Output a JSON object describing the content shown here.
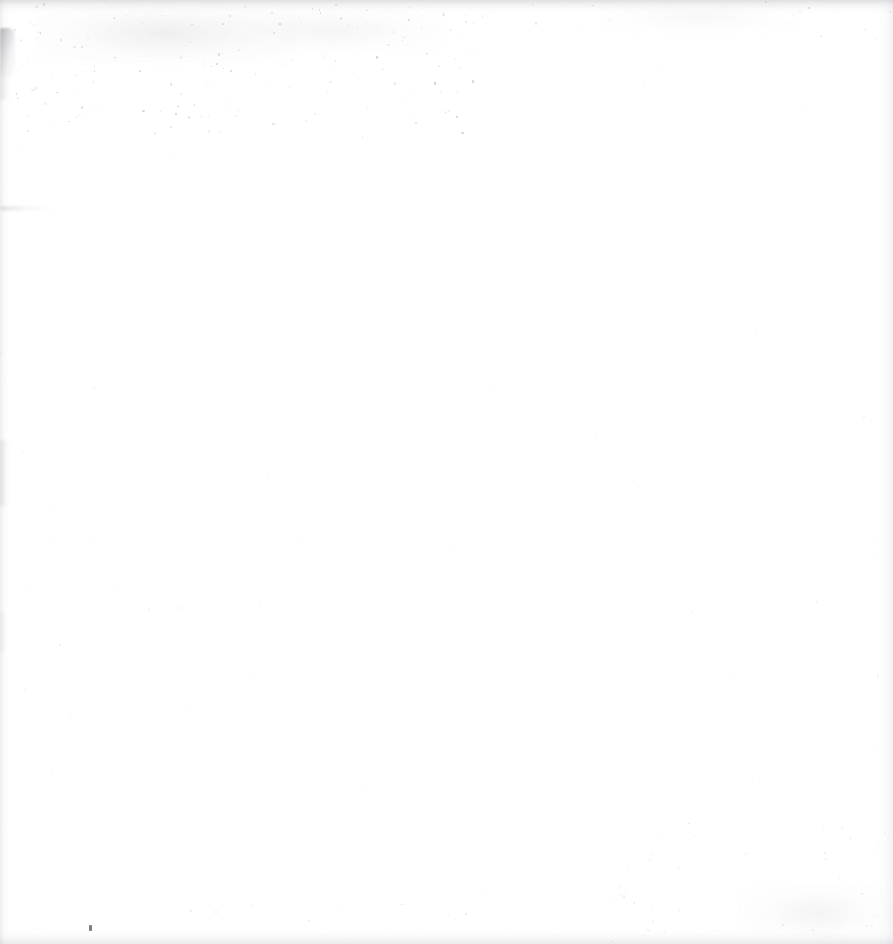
{
  "page": {
    "kind": "scanned-document-page",
    "state": "blank",
    "width": 893,
    "height": 944,
    "paper_color": "#ffffff",
    "paper_tone_edge": "#fdfdfd",
    "visible_text": "",
    "body_text": "",
    "page_number": "",
    "header_text": "",
    "footer_text": ""
  },
  "palette": {
    "paper": "#ffffff",
    "paper_shade": "#fdfdfd",
    "edge_band": "#b4b4bb",
    "blotch_dark": "#787880",
    "speck_dark": "#5c5c63",
    "dust_light": "#f0f0f2",
    "dust_mid": "#e2e2e6"
  },
  "edges": [
    {
      "name": "top-edge-band",
      "side": "top",
      "thickness": 13,
      "intensity": 0.3
    },
    {
      "name": "bottom-edge-band",
      "side": "bottom",
      "thickness": 16,
      "intensity": 0.22
    },
    {
      "name": "left-edge-band",
      "side": "left",
      "thickness": 9,
      "intensity": 0.2
    },
    {
      "name": "right-edge-band",
      "side": "right",
      "thickness": 16,
      "intensity": 0.17
    }
  ],
  "artifacts": [
    {
      "name": "left-margin-blotch",
      "type": "blotch",
      "x": 0,
      "y": 28,
      "w": 15,
      "h": 50,
      "opacity": 1.0
    },
    {
      "name": "left-margin-streak-upper",
      "type": "streak-v",
      "x": 0,
      "y": 78,
      "w": 11,
      "h": 22,
      "opacity": 0.7
    },
    {
      "name": "left-margin-streak-mid",
      "type": "streak-v",
      "x": 0,
      "y": 440,
      "w": 9,
      "h": 66,
      "opacity": 0.85
    },
    {
      "name": "left-margin-streak-low",
      "type": "streak-v",
      "x": 0,
      "y": 612,
      "w": 7,
      "h": 40,
      "opacity": 0.45
    },
    {
      "name": "left-horizontal-smudge",
      "type": "streak-h",
      "x": 0,
      "y": 206,
      "w": 56,
      "h": 5,
      "opacity": 0.9
    },
    {
      "name": "bottom-left-speck",
      "type": "speck",
      "x": 89,
      "y": 925,
      "w": 3,
      "h": 6,
      "opacity": 1.0
    },
    {
      "name": "upper-left-soft-smudge",
      "type": "smudge-soft",
      "x": 36,
      "y": 2,
      "w": 260,
      "h": 62,
      "opacity": 0.9
    },
    {
      "name": "upper-mid-soft-smudge",
      "type": "smudge-soft",
      "x": 215,
      "y": 6,
      "w": 230,
      "h": 48,
      "opacity": 0.55
    },
    {
      "name": "lower-right-soft-smudge",
      "type": "smudge-soft",
      "x": 742,
      "y": 884,
      "w": 150,
      "h": 58,
      "opacity": 0.6
    },
    {
      "name": "top-right-soft-smudge",
      "type": "smudge-soft",
      "x": 600,
      "y": 0,
      "w": 200,
      "h": 34,
      "opacity": 0.4
    }
  ],
  "dust_fields": [
    {
      "name": "dust-top-left-dense",
      "x": 8,
      "y": 0,
      "w": 470,
      "h": 135,
      "count": 170,
      "seed": 1337,
      "min_size": 0.7,
      "max_size": 2.6,
      "min_alpha": 0.05,
      "max_alpha": 0.34,
      "color": "#6e6e76"
    },
    {
      "name": "dust-top-band",
      "x": 0,
      "y": 0,
      "w": 893,
      "h": 40,
      "count": 90,
      "seed": 2911,
      "min_size": 0.6,
      "max_size": 2.0,
      "min_alpha": 0.04,
      "max_alpha": 0.26,
      "color": "#7a7a82"
    },
    {
      "name": "dust-page-sparse",
      "x": 0,
      "y": 60,
      "w": 893,
      "h": 884,
      "count": 230,
      "seed": 5521,
      "min_size": 0.6,
      "max_size": 2.0,
      "min_alpha": 0.02,
      "max_alpha": 0.12,
      "color": "#8c8c95"
    },
    {
      "name": "dust-bottom-right",
      "x": 600,
      "y": 820,
      "w": 293,
      "h": 124,
      "count": 90,
      "seed": 7703,
      "min_size": 0.6,
      "max_size": 2.2,
      "min_alpha": 0.03,
      "max_alpha": 0.17,
      "color": "#82828b"
    },
    {
      "name": "dust-bottom-band",
      "x": 0,
      "y": 900,
      "w": 893,
      "h": 44,
      "count": 70,
      "seed": 9137,
      "min_size": 0.6,
      "max_size": 1.9,
      "min_alpha": 0.03,
      "max_alpha": 0.18,
      "color": "#7d7d86"
    },
    {
      "name": "dust-left-column",
      "x": 0,
      "y": 100,
      "w": 90,
      "h": 800,
      "count": 55,
      "seed": 4243,
      "min_size": 0.6,
      "max_size": 1.8,
      "min_alpha": 0.03,
      "max_alpha": 0.15,
      "color": "#84848d"
    }
  ],
  "regions": [
    {
      "name": "text-block-region",
      "x": 70,
      "y": 80,
      "w": 760,
      "h": 790,
      "content": ""
    },
    {
      "name": "header-region",
      "x": 70,
      "y": 20,
      "w": 760,
      "h": 50,
      "content": ""
    },
    {
      "name": "footer-region",
      "x": 70,
      "y": 880,
      "w": 760,
      "h": 50,
      "content": ""
    }
  ]
}
